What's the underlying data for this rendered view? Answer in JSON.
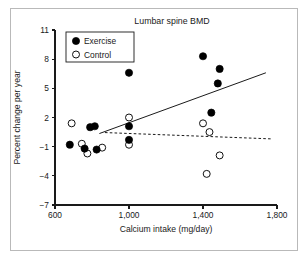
{
  "figure": {
    "title": "Lumbar spine BMD",
    "border_color": "#b9b9b9",
    "background": "#ffffff"
  },
  "chart_data": {
    "type": "scatter",
    "title": "Lumbar spine BMD",
    "xlabel": "Calcium intake (mg/day)",
    "ylabel": "Percent change per year",
    "xlim": [
      600,
      1800
    ],
    "ylim": [
      -7,
      11
    ],
    "xticks": [
      600,
      1000,
      1400,
      1800
    ],
    "xtick_labels": [
      "600",
      "1,000",
      "1,400",
      "1,800"
    ],
    "yticks": [
      -7,
      -4,
      -1,
      2,
      5,
      8,
      11
    ],
    "ytick_labels": [
      "−7",
      "−4",
      "−1",
      "2",
      "5",
      "8",
      "11"
    ],
    "grid": false,
    "legend_position": "top-left",
    "series": [
      {
        "name": "Exercise",
        "marker": "filled-circle",
        "color": "#000000",
        "points": [
          {
            "x": 680,
            "y": -0.8
          },
          {
            "x": 790,
            "y": 1.0
          },
          {
            "x": 815,
            "y": 1.1
          },
          {
            "x": 760,
            "y": -1.2
          },
          {
            "x": 825,
            "y": -1.3
          },
          {
            "x": 1000,
            "y": 6.6
          },
          {
            "x": 1000,
            "y": 1.1
          },
          {
            "x": 1000,
            "y": -0.3
          },
          {
            "x": 1400,
            "y": 8.3
          },
          {
            "x": 1490,
            "y": 7.0
          },
          {
            "x": 1480,
            "y": 5.5
          },
          {
            "x": 1445,
            "y": 2.5
          }
        ]
      },
      {
        "name": "Control",
        "marker": "open-circle",
        "color": "#ffffff",
        "points": [
          {
            "x": 690,
            "y": 1.4
          },
          {
            "x": 745,
            "y": -0.7
          },
          {
            "x": 775,
            "y": -1.7
          },
          {
            "x": 855,
            "y": -1.1
          },
          {
            "x": 1000,
            "y": 2.0
          },
          {
            "x": 1000,
            "y": -0.8
          },
          {
            "x": 1400,
            "y": 1.4
          },
          {
            "x": 1435,
            "y": 0.5
          },
          {
            "x": 1490,
            "y": -1.9
          },
          {
            "x": 1420,
            "y": -3.8
          }
        ]
      }
    ],
    "fit_lines": [
      {
        "name": "Exercise regression",
        "style": "solid",
        "x1": 840,
        "y1": 0.35,
        "x2": 1740,
        "y2": 6.6
      },
      {
        "name": "Control regression",
        "style": "dashed",
        "x1": 870,
        "y1": 0.45,
        "x2": 1770,
        "y2": -0.2
      }
    ],
    "legend": [
      {
        "label": "Exercise",
        "marker": "filled-circle"
      },
      {
        "label": "Control",
        "marker": "open-circle"
      }
    ]
  }
}
